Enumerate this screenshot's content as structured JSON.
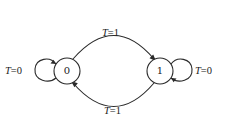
{
  "diagram": {
    "type": "state-diagram",
    "states": [
      {
        "id": "s0",
        "label": "0",
        "cx": 67,
        "cy": 71,
        "r": 13
      },
      {
        "id": "s1",
        "label": "1",
        "cx": 160,
        "cy": 71,
        "r": 13
      }
    ],
    "transitions": [
      {
        "from": "0",
        "to": "1",
        "var": "T",
        "op": "=",
        "value": "1",
        "position": "top"
      },
      {
        "from": "1",
        "to": "0",
        "var": "T",
        "op": "=",
        "value": "1",
        "position": "bottom"
      },
      {
        "from": "0",
        "to": "0",
        "var": "T",
        "op": "=",
        "value": "0",
        "position": "left-self-loop"
      },
      {
        "from": "1",
        "to": "1",
        "var": "T",
        "op": "=",
        "value": "0",
        "position": "right-self-loop"
      }
    ],
    "colors": {
      "stroke": "#2a2a2a",
      "text": "#222222",
      "background": "#ffffff"
    }
  }
}
